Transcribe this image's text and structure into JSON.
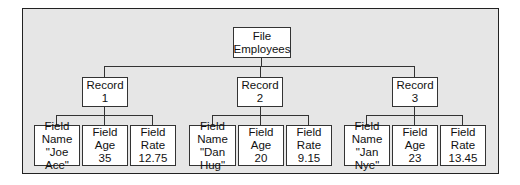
{
  "root": {
    "line1": "File",
    "line2": "Employees"
  },
  "records": [
    {
      "label": "Record",
      "number": "1",
      "fields": [
        {
          "line1": "Field",
          "line2": "Name",
          "value": "\"Joe Ace\""
        },
        {
          "line1": "Field",
          "line2": "Age",
          "value": "35"
        },
        {
          "line1": "Field",
          "line2": "Rate",
          "value": "12.75"
        }
      ]
    },
    {
      "label": "Record",
      "number": "2",
      "fields": [
        {
          "line1": "Field",
          "line2": "Name",
          "value": "\"Dan Hug\""
        },
        {
          "line1": "Field",
          "line2": "Age",
          "value": "20"
        },
        {
          "line1": "Field",
          "line2": "Rate",
          "value": "9.15"
        }
      ]
    },
    {
      "label": "Record",
      "number": "3",
      "fields": [
        {
          "line1": "Field",
          "line2": "Name",
          "value": "\"Jan Nye\""
        },
        {
          "line1": "Field",
          "line2": "Age",
          "value": "23"
        },
        {
          "line1": "Field",
          "line2": "Rate",
          "value": "13.45"
        }
      ]
    }
  ],
  "colors": {
    "background": "#e6e6e6",
    "box": "#ffffff",
    "line": "#333333"
  }
}
